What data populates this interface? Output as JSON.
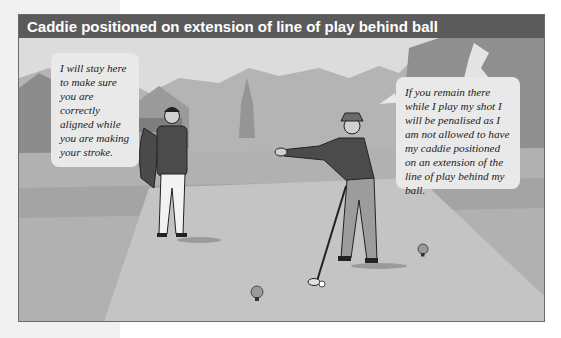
{
  "figure": {
    "title": "Caddie positioned on extension of line of play behind ball",
    "bubbles": {
      "caddie": "I will stay here to make sure you are correctly aligned while you are making your stroke.",
      "player": "If you remain there while I play my shot I will be penalised as I am not allowed to have my caddie positioned on an extension of the line of play behind my ball."
    },
    "colors": {
      "header_bg": "#5b5b5b",
      "bubble_bg": "#e9e9e9",
      "sky": "#e0e0e0",
      "fairway": "#bdbdbd",
      "rough": "#a8a8a8"
    }
  }
}
